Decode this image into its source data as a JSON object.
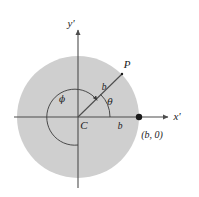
{
  "figure": {
    "background_color": "#ffffff",
    "disk": {
      "name": "shaded-disk",
      "fill_color": "#cfcfcf",
      "center_label": "C",
      "radius_px": 61
    },
    "axes": {
      "x_axis_label": "x'",
      "y_axis_label": "y'",
      "line_color": "#555555",
      "origin_label": "C"
    },
    "labels": {
      "point_p": "P",
      "radius_to_p": "b",
      "radius_on_axis": "b",
      "angle_theta": "θ",
      "angle_phi": "ϕ",
      "boundary_point": "(b, 0)"
    },
    "markers": {
      "point_on_axis_name": "point-b-zero",
      "point_on_axis_color": "#1a1a1a"
    },
    "colors": {
      "disk_fill": "#cfcfcf",
      "stroke": "#4d4d4d",
      "text": "#1a1a1a"
    }
  }
}
